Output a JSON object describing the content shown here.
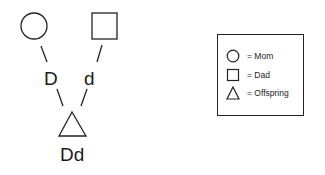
{
  "diagram": {
    "parents": {
      "mom": {
        "shape": "circle",
        "allele": "D"
      },
      "dad": {
        "shape": "square",
        "allele": "d"
      }
    },
    "offspring": {
      "shape": "triangle",
      "genotype": "Dd"
    }
  },
  "legend": {
    "items": [
      {
        "icon": "circle-icon",
        "label": "= Mom"
      },
      {
        "icon": "square-icon",
        "label": "= Dad"
      },
      {
        "icon": "triangle-icon",
        "label": "= Offspring"
      }
    ]
  },
  "colors": {
    "stroke": "#222222",
    "background": "#ffffff"
  }
}
